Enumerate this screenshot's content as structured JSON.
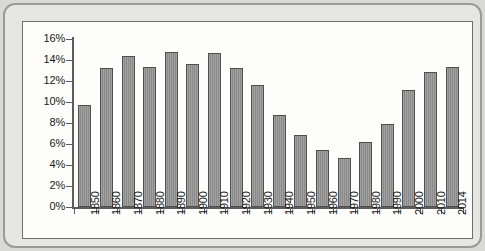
{
  "chart_data": {
    "type": "bar",
    "title": "",
    "xlabel": "",
    "ylabel": "",
    "categories": [
      "1850",
      "1860",
      "1870",
      "1880",
      "1890",
      "1900",
      "1910",
      "1920",
      "1930",
      "1940",
      "1950",
      "1960",
      "1970",
      "1980",
      "1990",
      "2000",
      "2010",
      "2014"
    ],
    "values": [
      9.7,
      13.2,
      14.4,
      13.3,
      14.8,
      13.6,
      14.7,
      13.2,
      11.6,
      8.8,
      6.9,
      5.4,
      4.7,
      6.2,
      7.9,
      11.1,
      12.9,
      13.3
    ],
    "ylim": [
      0,
      16
    ],
    "ytick_labels": [
      "0%",
      "2%",
      "4%",
      "6%",
      "8%",
      "10%",
      "12%",
      "14%",
      "16%"
    ],
    "ytick_values": [
      0,
      2,
      4,
      6,
      8,
      10,
      12,
      14,
      16
    ],
    "grid": false,
    "legend": false,
    "value_suffix": "%",
    "series": [
      {
        "name": "",
        "values": [
          9.7,
          13.2,
          14.4,
          13.3,
          14.8,
          13.6,
          14.7,
          13.2,
          11.6,
          8.8,
          6.9,
          5.4,
          4.7,
          6.2,
          7.9,
          11.1,
          12.9,
          13.3
        ]
      }
    ],
    "colors": {
      "bar_fill": "#8a8a8a",
      "bar_border": "#4f4f4f",
      "axis": "#5d5d5d",
      "plot_background": "#fdfdfb",
      "panel_border": "#6f6f6f",
      "frame_background": "#e6e6e3",
      "frame_border": "#9a9a97",
      "page_background": "#d9d9d6",
      "text": "#1a1a1a"
    }
  }
}
